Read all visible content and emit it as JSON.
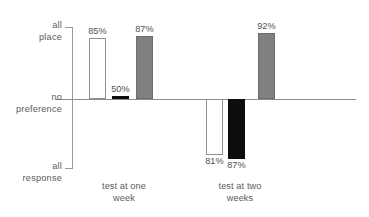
{
  "chart_data": {
    "type": "bar",
    "title": "",
    "xlabel": "",
    "ylabel": "",
    "orientation": "vertical",
    "baseline_label": "no preference",
    "axis": {
      "top_label_line1": "all",
      "top_label_line2": "place",
      "mid_label_line1": "no",
      "mid_label_line2": "preference",
      "bottom_label_line1": "all",
      "bottom_label_line2": "response",
      "grid": false,
      "legend": false
    },
    "categories": [
      "test at one week",
      "test at two weeks"
    ],
    "groups": [
      {
        "label_line1": "test at one",
        "label_line2": "week",
        "bars": [
          {
            "value": 85,
            "value_label": "85%",
            "direction": "up",
            "fill": "white",
            "magnitude": 0.85
          },
          {
            "value": 50,
            "value_label": "50%",
            "direction": "up",
            "fill": "black",
            "magnitude": 0.02
          },
          {
            "value": 87,
            "value_label": "87%",
            "direction": "up",
            "fill": "gray",
            "magnitude": 0.87
          }
        ]
      },
      {
        "label_line1": "test at two",
        "label_line2": "weeks",
        "bars": [
          {
            "value": 81,
            "value_label": "81%",
            "direction": "down",
            "fill": "white",
            "magnitude": 0.81
          },
          {
            "value": 87,
            "value_label": "87%",
            "direction": "down",
            "fill": "black",
            "magnitude": 0.87
          },
          {
            "value": 92,
            "value_label": "92%",
            "direction": "up",
            "fill": "gray",
            "magnitude": 0.92
          }
        ]
      }
    ],
    "colors": {
      "white_bar": "#ffffff",
      "gray_bar": "#808080",
      "black_bar": "#0d0d0d",
      "axis": "#8d8d8d",
      "text": "#5b5b5b"
    }
  }
}
